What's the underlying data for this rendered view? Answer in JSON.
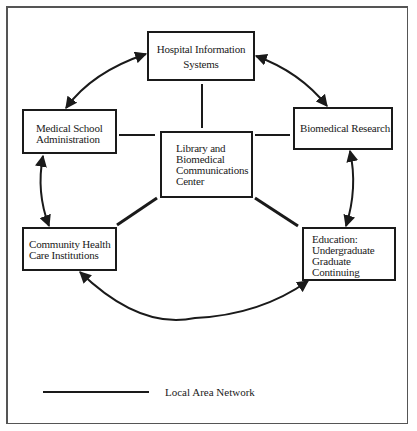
{
  "diagram": {
    "type": "network-topology",
    "nodes": {
      "hospital": {
        "label": "Hospital Information\nSystems"
      },
      "medical_school": {
        "label": "Medical School\nAdministration"
      },
      "library": {
        "label": "Library and\nBiomedical\nCommunications\nCenter"
      },
      "biomedical_research": {
        "label": "Biomedical Research"
      },
      "community_health": {
        "label": "Community Health\nCare Institutions"
      },
      "education": {
        "label": "Education:\nUndergraduate\nGraduate\nContinuing"
      }
    },
    "edges": [
      {
        "from": "library",
        "to": "hospital",
        "style": "lan-line"
      },
      {
        "from": "library",
        "to": "medical_school",
        "style": "lan-line"
      },
      {
        "from": "library",
        "to": "biomedical_research",
        "style": "lan-line"
      },
      {
        "from": "library",
        "to": "community_health",
        "style": "lan-line-thick"
      },
      {
        "from": "library",
        "to": "education",
        "style": "lan-line-thick"
      },
      {
        "from": "hospital",
        "to": "medical_school",
        "style": "bidirectional-arc"
      },
      {
        "from": "hospital",
        "to": "biomedical_research",
        "style": "bidirectional-arc"
      },
      {
        "from": "medical_school",
        "to": "community_health",
        "style": "bidirectional-arc"
      },
      {
        "from": "biomedical_research",
        "to": "education",
        "style": "bidirectional-arc"
      },
      {
        "from": "community_health",
        "to": "education",
        "style": "bidirectional-arc"
      }
    ],
    "legend": {
      "line_label": "Local Area Network"
    },
    "colors": {
      "stroke": "#1a1a1a",
      "frame": "#555555",
      "background": "#ffffff"
    }
  }
}
